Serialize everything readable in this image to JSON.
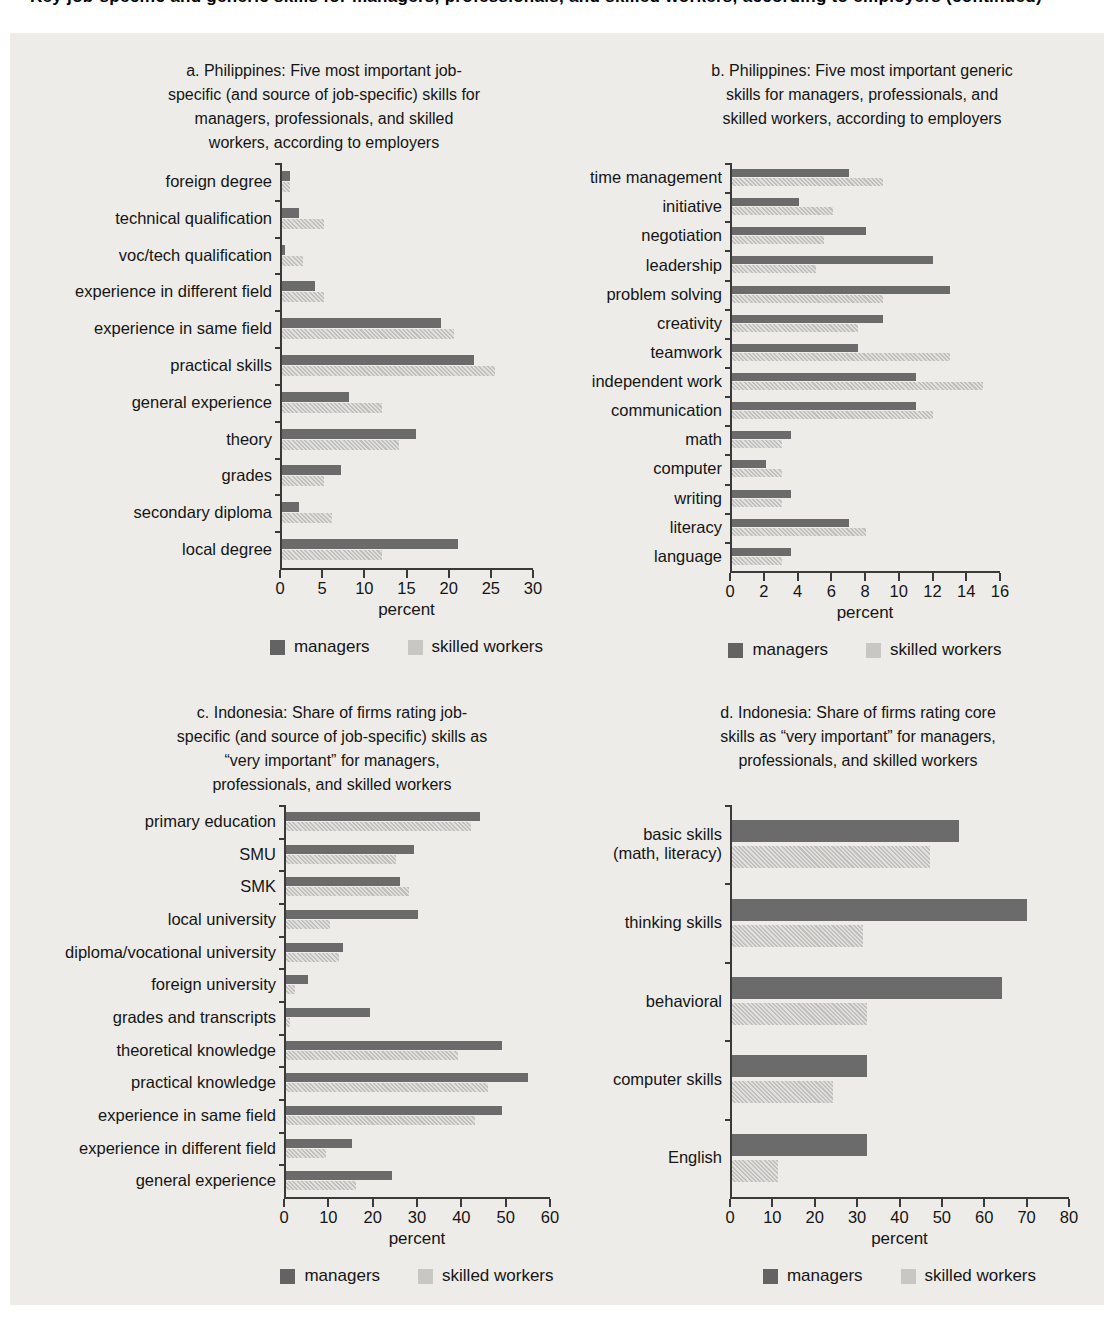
{
  "page": {
    "clipped_heading": "Key job-specific and generic skills for managers, professionals, and skilled workers, according to employers (continued)"
  },
  "colors": {
    "managers": "#6b6b6b",
    "skilled_workers": "#c8c7c3",
    "axis": "#3a3a3a",
    "figure_background": "#edece8",
    "page_background": "#ffffff"
  },
  "legend": {
    "managers_label": "managers",
    "skilled_label": "skilled workers"
  },
  "chart_data": [
    {
      "id": "a",
      "type": "bar",
      "orientation": "horizontal",
      "title_lines": [
        "a. Philippines: Five most important job-",
        "specific (and source of job-specific) skills for",
        "managers, professionals, and skilled",
        "workers, according to employers"
      ],
      "categories": [
        "foreign degree",
        "technical qualification",
        "voc/tech qualification",
        "experience in different field",
        "experience in same field",
        "practical skills",
        "general experience",
        "theory",
        "grades",
        "secondary diploma",
        "local degree"
      ],
      "series": [
        {
          "name": "managers",
          "values": [
            1,
            2,
            0.4,
            4,
            19,
            23,
            8,
            16,
            7,
            2,
            21
          ]
        },
        {
          "name": "skilled workers",
          "values": [
            1,
            5,
            2.5,
            5,
            20.5,
            25.5,
            12,
            14,
            5,
            6,
            12
          ]
        }
      ],
      "xlabel": "percent",
      "xlim": [
        0,
        30
      ],
      "xticks": [
        0,
        5,
        10,
        15,
        20,
        25,
        30
      ],
      "layout": {
        "label_width": 248,
        "plot_width": 253,
        "plot_height": 405,
        "bar_height": 10,
        "bar_gap": 1,
        "title_center": 292
      }
    },
    {
      "id": "b",
      "type": "bar",
      "orientation": "horizontal",
      "title_lines": [
        "b. Philippines: Five most important generic",
        "skills for managers, professionals, and",
        "skilled workers, according to employers"
      ],
      "categories": [
        "time management",
        "initiative",
        "negotiation",
        "leadership",
        "problem solving",
        "creativity",
        "teamwork",
        "independent work",
        "communication",
        "math",
        "computer",
        "writing",
        "literacy",
        "language"
      ],
      "series": [
        {
          "name": "managers",
          "values": [
            7,
            4,
            8,
            12,
            13,
            9,
            7.5,
            11,
            11,
            3.5,
            2,
            3.5,
            7,
            3.5
          ]
        },
        {
          "name": "skilled workers",
          "values": [
            9,
            6,
            5.5,
            5,
            9,
            7.5,
            13,
            15,
            12,
            3,
            3,
            3,
            8,
            3
          ]
        }
      ],
      "xlabel": "percent",
      "xlim": [
        0,
        16
      ],
      "xticks": [
        0,
        2,
        4,
        6,
        8,
        10,
        12,
        14,
        16
      ],
      "layout": {
        "label_width": 158,
        "plot_width": 270,
        "plot_height": 408,
        "bar_height": 8,
        "bar_gap": 1,
        "title_center": 290
      }
    },
    {
      "id": "c",
      "type": "bar",
      "orientation": "horizontal",
      "title_lines": [
        "c. Indonesia: Share of firms rating job-",
        "specific (and source of job-specific) skills as",
        "“very important” for managers,",
        "professionals, and skilled workers"
      ],
      "categories": [
        "primary education",
        "SMU",
        "SMK",
        "local university",
        "diploma/vocational university",
        "foreign university",
        "grades and transcripts",
        "theoretical knowledge",
        "practical knowledge",
        "experience in same field",
        "experience in different field",
        "general experience"
      ],
      "series": [
        {
          "name": "managers",
          "values": [
            44,
            29,
            26,
            30,
            13,
            5,
            19,
            49,
            55,
            49,
            15,
            24
          ]
        },
        {
          "name": "skilled workers",
          "values": [
            42,
            25,
            28,
            10,
            12,
            2,
            1,
            39,
            46,
            43,
            9,
            16
          ]
        }
      ],
      "xlabel": "percent",
      "xlim": [
        0,
        60
      ],
      "xticks": [
        0,
        10,
        20,
        30,
        40,
        50,
        60
      ],
      "layout": {
        "label_width": 252,
        "plot_width": 266,
        "plot_height": 392,
        "bar_height": 9,
        "bar_gap": 1,
        "title_center": 300
      }
    },
    {
      "id": "d",
      "type": "bar",
      "orientation": "horizontal",
      "title_lines": [
        "d. Indonesia: Share of firms rating core",
        "skills as “very important” for managers,",
        "professionals, and skilled workers"
      ],
      "categories": [
        [
          "basic skills",
          "(math, literacy)"
        ],
        "thinking skills",
        "behavioral",
        "computer skills",
        "English"
      ],
      "series": [
        {
          "name": "managers",
          "values": [
            54,
            70,
            64,
            32,
            32
          ]
        },
        {
          "name": "skilled workers",
          "values": [
            47,
            31,
            32,
            24,
            11
          ]
        }
      ],
      "xlabel": "percent",
      "xlim": [
        0,
        80
      ],
      "xticks": [
        0,
        10,
        20,
        30,
        40,
        50,
        60,
        70,
        80
      ],
      "layout": {
        "label_width": 158,
        "plot_width": 339,
        "plot_height": 392,
        "bar_height": 22,
        "bar_gap": 4,
        "title_center": 286
      }
    }
  ]
}
